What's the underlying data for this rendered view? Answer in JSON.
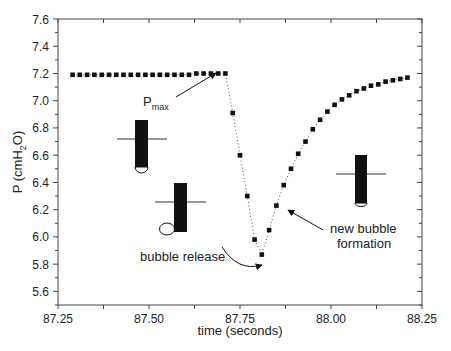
{
  "chart_data": {
    "type": "scatter",
    "title": "",
    "xlabel": "time (seconds)",
    "ylabel": "P (cmH2O)",
    "ylabel_parts": {
      "main": "P (cmH",
      "sub": "2",
      "end": "O)"
    },
    "xlim": [
      87.25,
      88.25
    ],
    "ylim": [
      5.5,
      7.6
    ],
    "x_ticks": [
      87.25,
      87.5,
      87.75,
      88.0,
      88.25
    ],
    "x_tick_labels": [
      "87.25",
      "87.50",
      "87.75",
      "88.00",
      "88.25"
    ],
    "y_ticks": [
      5.6,
      5.8,
      6.0,
      6.2,
      6.4,
      6.6,
      6.8,
      7.0,
      7.2,
      7.4,
      7.6
    ],
    "y_tick_labels": [
      "5.6",
      "5.8",
      "6.0",
      "6.2",
      "6.4",
      "6.6",
      "6.8",
      "7.0",
      "7.2",
      "7.4",
      "7.6"
    ],
    "grid": false,
    "legend": null,
    "series": [
      {
        "name": "pressure",
        "marker": "square",
        "line": "dotted",
        "x": [
          87.29,
          87.31,
          87.33,
          87.35,
          87.37,
          87.39,
          87.41,
          87.43,
          87.45,
          87.47,
          87.49,
          87.51,
          87.53,
          87.55,
          87.57,
          87.59,
          87.61,
          87.63,
          87.65,
          87.67,
          87.69,
          87.71,
          87.73,
          87.75,
          87.77,
          87.79,
          87.81,
          87.83,
          87.85,
          87.87,
          87.89,
          87.91,
          87.93,
          87.95,
          87.97,
          87.99,
          88.01,
          88.03,
          88.05,
          88.07,
          88.09,
          88.11,
          88.13,
          88.15,
          88.17,
          88.19,
          88.21
        ],
        "y": [
          7.19,
          7.19,
          7.19,
          7.19,
          7.19,
          7.19,
          7.19,
          7.19,
          7.19,
          7.19,
          7.19,
          7.19,
          7.19,
          7.19,
          7.19,
          7.19,
          7.19,
          7.2,
          7.2,
          7.2,
          7.2,
          7.2,
          6.91,
          6.6,
          6.3,
          5.98,
          5.87,
          6.05,
          6.23,
          6.38,
          6.5,
          6.61,
          6.7,
          6.79,
          6.86,
          6.92,
          6.97,
          7.01,
          7.04,
          7.07,
          7.09,
          7.11,
          7.12,
          7.14,
          7.15,
          7.16,
          7.17
        ]
      }
    ],
    "annotations": [
      {
        "text": "P",
        "sub": "max",
        "points_to": [
          87.7,
          7.2
        ]
      },
      {
        "text": "bubble release",
        "points_to": [
          87.81,
          5.86
        ]
      },
      {
        "text": "new bubble",
        "text2": "formation",
        "points_to": [
          87.87,
          6.23
        ]
      }
    ],
    "insets": [
      {
        "name": "bubble-growing-diagram",
        "bubble": "half-sphere at tip"
      },
      {
        "name": "bubble-release-diagram",
        "bubble": "detached bubble at tip"
      },
      {
        "name": "new-bubble-diagram",
        "bubble": "small bubble at tip"
      }
    ]
  }
}
